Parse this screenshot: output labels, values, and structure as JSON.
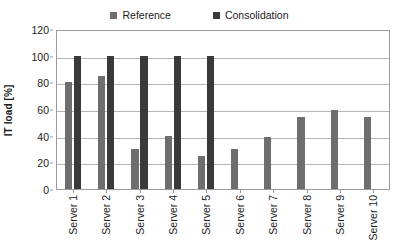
{
  "chart_data": {
    "type": "bar",
    "title": "",
    "xlabel": "",
    "ylabel": "IT load [%]",
    "ylim": [
      0,
      120
    ],
    "yticks": [
      0,
      20,
      40,
      60,
      80,
      100,
      120
    ],
    "grid": true,
    "legend_position": "top-center",
    "categories": [
      "Server 1",
      "Server 2",
      "Server 3",
      "Server 4",
      "Server 5",
      "Server 6",
      "Server 7",
      "Server 8",
      "Server 9",
      "Server 10"
    ],
    "series": [
      {
        "name": "Reference",
        "color": "#6e6e6e",
        "values": [
          80,
          85,
          30,
          40,
          25,
          30,
          39,
          54,
          59,
          54
        ]
      },
      {
        "name": "Consolidation",
        "color": "#3a3a3a",
        "values": [
          100,
          100,
          100,
          100,
          100,
          0,
          0,
          0,
          0,
          0
        ]
      }
    ]
  },
  "legend": {
    "entries": [
      {
        "label": "Reference",
        "color": "#6e6e6e"
      },
      {
        "label": "Consolidation",
        "color": "#3a3a3a"
      }
    ]
  },
  "axes": {
    "y_title": "IT load [%]",
    "y_tick_labels": [
      "120",
      "100",
      "80",
      "60",
      "40",
      "20",
      "0"
    ],
    "x_tick_labels": [
      "Server 1",
      "Server 2",
      "Server 3",
      "Server 4",
      "Server 5",
      "Server 6",
      "Server 7",
      "Server 8",
      "Server 9",
      "Server 10"
    ]
  },
  "colors": {
    "reference": "#6e6e6e",
    "consolidation": "#3a3a3a",
    "gridline": "#b5b5b5",
    "axis": "#9a9a9a",
    "background": "#ffffff",
    "text": "#1c1c1c"
  }
}
